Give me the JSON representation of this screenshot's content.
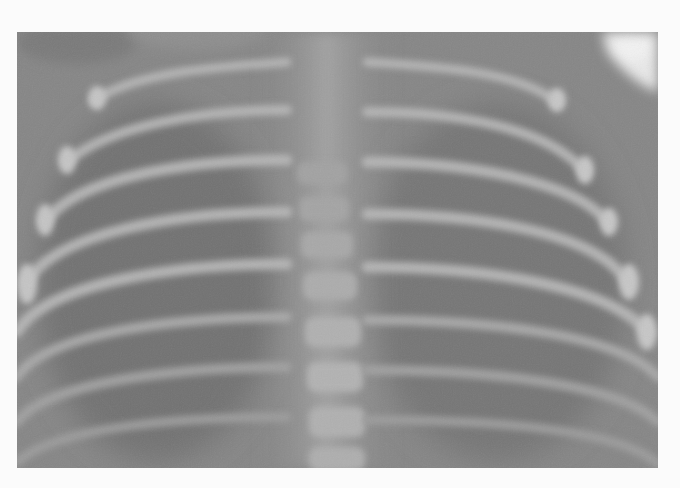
{
  "image": {
    "subject": "chest radiograph",
    "description": "Frontal chest X-ray showing curved ribs on both sides of a central vertebral column, grayscale",
    "colors": {
      "page_background": "#fbfbfb",
      "base_gray": "#858585",
      "lung_dark": "#6e6e6e",
      "bone_light": "#b8b8b8",
      "highlight": "#e6e6e6"
    },
    "frame": {
      "left": 17,
      "top": 32,
      "width": 641,
      "height": 436
    }
  }
}
